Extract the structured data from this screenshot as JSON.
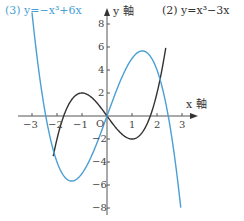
{
  "chart_data": {
    "type": "line",
    "title": "",
    "xlabel": "x 軸",
    "ylabel": "y 軸",
    "origin_label": "O",
    "xlim": [
      -3.3,
      3.6
    ],
    "ylim": [
      -8.5,
      9
    ],
    "x_ticks": [
      -3,
      -2,
      -1,
      1,
      2,
      3
    ],
    "x_tick_labels": [
      "−3",
      "−2",
      "−1",
      "1",
      "2",
      "3"
    ],
    "y_ticks": [
      8,
      6,
      4,
      2,
      -2,
      -4,
      -6,
      -8
    ],
    "y_tick_labels": [
      "8",
      "6",
      "4",
      "2",
      "−2",
      "−4",
      "−6",
      "−8"
    ],
    "grid": false,
    "series": [
      {
        "name": "(2) y=x³−3x",
        "label": "(2)  y=x³−3x",
        "expression": "x^3-3x",
        "color": "#333333",
        "x_range": [
          -2.15,
          2.35
        ],
        "key_points": [
          [
            -2,
            -2
          ],
          [
            -1,
            2
          ],
          [
            0,
            0
          ],
          [
            1,
            -2
          ],
          [
            2,
            2
          ]
        ]
      },
      {
        "name": "(3) y=−x³+6x",
        "label": "(3)  y=−x³+6x",
        "expression": "-x^3+6x",
        "color": "#4a9fd4",
        "x_range": [
          -3.0,
          2.95
        ],
        "key_points": [
          [
            -2.45,
            0
          ],
          [
            -1.41,
            -5.66
          ],
          [
            0,
            0
          ],
          [
            1.41,
            5.66
          ],
          [
            2.45,
            0
          ]
        ]
      }
    ],
    "intersections": [
      [
        -2.12,
        -3.18
      ],
      [
        0,
        0
      ],
      [
        2.12,
        3.18
      ]
    ]
  }
}
